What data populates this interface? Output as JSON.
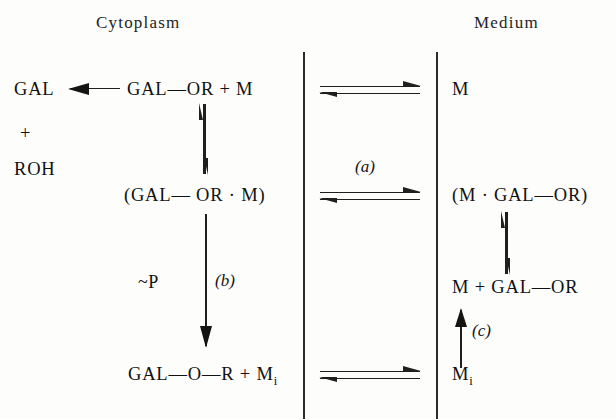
{
  "figure": {
    "type": "biochemical-transport-scheme",
    "headers": {
      "left": "Cytoplasm",
      "right": "Medium"
    },
    "cytoplasm": {
      "product_gal": "GAL",
      "product_plus": "+",
      "product_roh": "ROH",
      "substrate_row": "GAL—OR  +  M",
      "complex_row": "(GAL— OR · M)",
      "energy_label": "~P",
      "step_b": "(b)",
      "product_row": "GAL—O—R  +  M",
      "product_row_sub": "i"
    },
    "medium": {
      "carrier": "M",
      "complex_row": "(M · GAL—OR)",
      "release_row": "M  +  GAL—OR",
      "step_c": "(c)",
      "carrier_inactive": "M",
      "carrier_inactive_sub": "i",
      "bottom_species": "M",
      "bottom_species_sub": "i"
    },
    "membrane": {
      "step_a": "(a)"
    },
    "colors": {
      "ink": "#1a1a1a",
      "rule": "#2b2b2b",
      "background": "#fdfdfc"
    }
  }
}
